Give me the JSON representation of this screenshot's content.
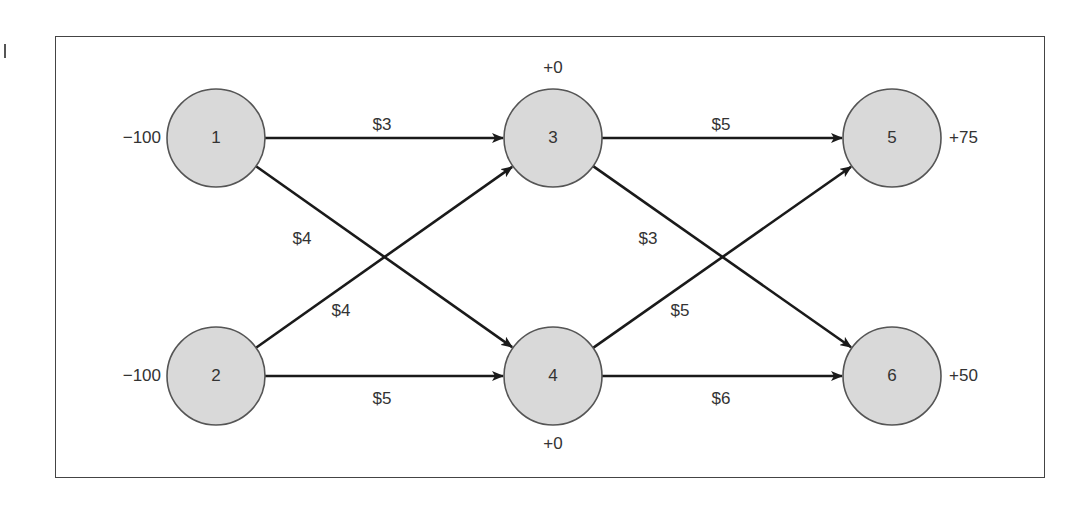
{
  "diagram": {
    "type": "network-flow",
    "style": {
      "node_fill": "#d9d9d9",
      "node_stroke": "#555555",
      "edge_color": "#1a1a1a",
      "frame_color": "#444444"
    },
    "nodes": [
      {
        "id": "1",
        "label": "1",
        "supply_label": "−100",
        "x": 216,
        "y": 138,
        "label_pos": "left"
      },
      {
        "id": "2",
        "label": "2",
        "supply_label": "−100",
        "x": 216,
        "y": 376,
        "label_pos": "left"
      },
      {
        "id": "3",
        "label": "3",
        "supply_label": "+0",
        "x": 553,
        "y": 138,
        "label_pos": "top"
      },
      {
        "id": "4",
        "label": "4",
        "supply_label": "+0",
        "x": 553,
        "y": 376,
        "label_pos": "bottom"
      },
      {
        "id": "5",
        "label": "5",
        "supply_label": "+75",
        "x": 892,
        "y": 138,
        "label_pos": "right"
      },
      {
        "id": "6",
        "label": "6",
        "supply_label": "+50",
        "x": 892,
        "y": 376,
        "label_pos": "right"
      }
    ],
    "edges": [
      {
        "from": "1",
        "to": "3",
        "cost_label": "$3",
        "lx": 382,
        "ly": 126
      },
      {
        "from": "1",
        "to": "4",
        "cost_label": "$4",
        "lx": 302,
        "ly": 240
      },
      {
        "from": "2",
        "to": "3",
        "cost_label": "$4",
        "lx": 341,
        "ly": 312
      },
      {
        "from": "2",
        "to": "4",
        "cost_label": "$5",
        "lx": 382,
        "ly": 400
      },
      {
        "from": "3",
        "to": "5",
        "cost_label": "$5",
        "lx": 721,
        "ly": 126
      },
      {
        "from": "3",
        "to": "6",
        "cost_label": "$3",
        "lx": 648,
        "ly": 240
      },
      {
        "from": "4",
        "to": "5",
        "cost_label": "$5",
        "lx": 680,
        "ly": 312
      },
      {
        "from": "4",
        "to": "6",
        "cost_label": "$6",
        "lx": 721,
        "ly": 400
      }
    ],
    "node_radius": 49
  }
}
